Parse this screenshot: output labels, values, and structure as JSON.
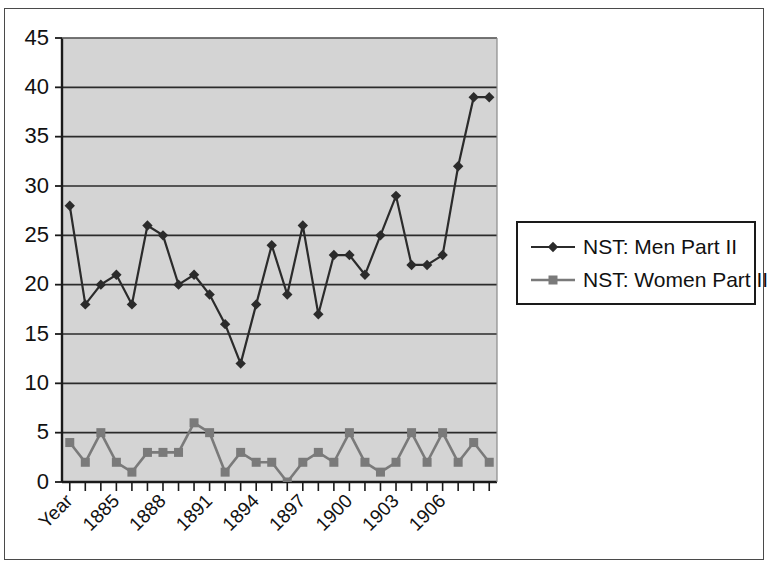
{
  "figure": {
    "background_color": "#ffffff",
    "frame_color": "#4a4a4a",
    "plot_background_color": "#d4d4d4",
    "axis_color": "#1a1a1a",
    "gridline_color": "#2b2b2b"
  },
  "legend": {
    "position": "right",
    "border_color": "#1a1a1a",
    "entries": [
      {
        "label": "NST: Men Part II",
        "marker": "diamond",
        "color": "#2b2b2b"
      },
      {
        "label": "NST: Women Part II",
        "marker": "square",
        "color": "#7a7a7a"
      }
    ]
  },
  "axes": {
    "y_ticks": [
      "45",
      "40",
      "35",
      "30",
      "25",
      "20",
      "15",
      "10",
      "5",
      "0"
    ],
    "x_tick_labels": [
      "Year",
      "1885",
      "1888",
      "1891",
      "1894",
      "1897",
      "1900",
      "1903",
      "1906"
    ],
    "x_label_rotation": -45
  },
  "chart_data": {
    "type": "line",
    "title": "",
    "xlabel": "Year",
    "ylabel": "",
    "ylim": [
      0,
      45
    ],
    "ytick_step": 5,
    "grid": true,
    "legend_position": "right",
    "x": [
      1882,
      1883,
      1884,
      1885,
      1886,
      1887,
      1888,
      1889,
      1890,
      1891,
      1892,
      1893,
      1894,
      1895,
      1896,
      1897,
      1898,
      1899,
      1900,
      1901,
      1902,
      1903,
      1904,
      1905,
      1906,
      1907,
      1908,
      1909
    ],
    "categories": [
      "Year",
      "",
      "",
      "1885",
      "",
      "",
      "1888",
      "",
      "",
      "1891",
      "",
      "",
      "1894",
      "",
      "",
      "1897",
      "",
      "",
      "1900",
      "",
      "",
      "1903",
      "",
      "",
      "1906",
      "",
      "",
      ""
    ],
    "series": [
      {
        "name": "NST: Men Part II",
        "marker": "diamond",
        "color": "#2b2b2b",
        "values": [
          28,
          18,
          20,
          21,
          18,
          26,
          25,
          20,
          21,
          19,
          16,
          12,
          18,
          24,
          19,
          26,
          17,
          23,
          23,
          21,
          25,
          29,
          22,
          22,
          23,
          32,
          39,
          39
        ]
      },
      {
        "name": "NST: Women Part II",
        "marker": "square",
        "color": "#7a7a7a",
        "values": [
          4,
          2,
          5,
          2,
          1,
          3,
          3,
          3,
          6,
          5,
          1,
          3,
          2,
          2,
          0,
          2,
          3,
          2,
          5,
          2,
          1,
          2,
          5,
          2,
          5,
          2,
          4,
          2
        ]
      }
    ]
  }
}
